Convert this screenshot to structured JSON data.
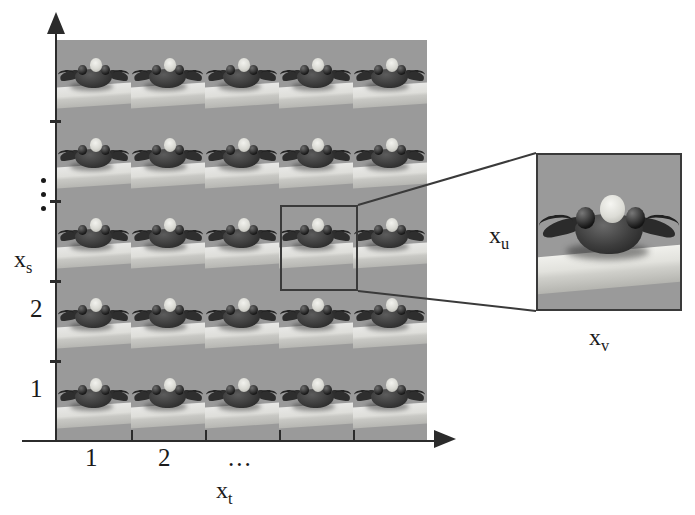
{
  "figure": {
    "type": "schematic-grid-diagram",
    "background_color": "#ffffff",
    "grid_fill_color": "#999999",
    "line_color": "#2b2b2b"
  },
  "axes": {
    "y": {
      "label": "x",
      "label_sub": "s",
      "tick_labels": [
        "1",
        "2"
      ],
      "ellipsis": "vertical-dots",
      "tick_count": 4,
      "arrow": "up"
    },
    "x": {
      "label": "x",
      "label_sub": "t",
      "tick_labels": [
        "1",
        "2",
        "..."
      ],
      "tick_count": 4,
      "arrow": "right"
    }
  },
  "grid": {
    "rows": 5,
    "columns": 5,
    "cell_content": "beetle-photo-frame",
    "selected_cell": {
      "row": 3,
      "column": 4
    }
  },
  "detail": {
    "label_vertical": "x",
    "label_vertical_sub": "u",
    "label_horizontal": "x",
    "label_horizontal_sub": "v",
    "content": "beetle-photo-frame-zoomed"
  },
  "callout": {
    "from": "selected_cell",
    "to": "detail_panel",
    "style": "two-straight-lines"
  }
}
